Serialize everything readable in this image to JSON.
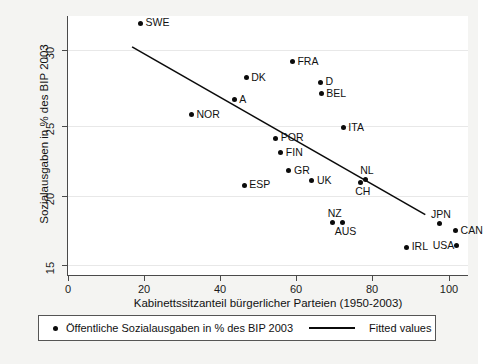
{
  "chart_data": {
    "type": "scatter",
    "title": "",
    "xlabel": "Kabinettssitzanteil bürgerlicher Parteien (1950-2003)",
    "ylabel": "Sozialausgaben in % des BIP 2003",
    "xlim": [
      0,
      103
    ],
    "ylim": [
      14.2,
      31.8
    ],
    "xticks": [
      0,
      20,
      40,
      60,
      80,
      100
    ],
    "yticks": [
      15,
      20,
      25,
      30
    ],
    "grid": true,
    "grid_axis": "y",
    "legend_position": "below-axes",
    "legend": [
      {
        "marker": "dot",
        "label": "Öffentliche Sozialausgaben in % des BIP  2003"
      },
      {
        "marker": "line",
        "label": "Fitted values"
      }
    ],
    "points": [
      {
        "label": "SWE",
        "x": 18.7,
        "y": 31.3,
        "label_pos": "right"
      },
      {
        "label": "DK",
        "x": 45.9,
        "y": 27.6,
        "label_pos": "right"
      },
      {
        "label": "FRA",
        "x": 57.8,
        "y": 28.7,
        "label_pos": "right"
      },
      {
        "label": "D",
        "x": 65.0,
        "y": 27.3,
        "label_pos": "right"
      },
      {
        "label": "BEL",
        "x": 65.2,
        "y": 26.5,
        "label_pos": "right"
      },
      {
        "label": "A",
        "x": 42.8,
        "y": 26.1,
        "label_pos": "right"
      },
      {
        "label": "NOR",
        "x": 31.8,
        "y": 25.1,
        "label_pos": "right"
      },
      {
        "label": "ITA",
        "x": 70.9,
        "y": 24.2,
        "label_pos": "right"
      },
      {
        "label": "POR",
        "x": 53.5,
        "y": 23.5,
        "label_pos": "right"
      },
      {
        "label": "FIN",
        "x": 54.8,
        "y": 22.5,
        "label_pos": "right"
      },
      {
        "label": "GR",
        "x": 56.9,
        "y": 21.3,
        "label_pos": "right"
      },
      {
        "label": "UK",
        "x": 62.8,
        "y": 20.6,
        "label_pos": "right"
      },
      {
        "label": "ESP",
        "x": 45.4,
        "y": 20.3,
        "label_pos": "right"
      },
      {
        "label": "NL",
        "x": 76.6,
        "y": 20.7,
        "label_pos": "above"
      },
      {
        "label": "CH",
        "x": 75.3,
        "y": 20.5,
        "label_pos": "below"
      },
      {
        "label": "NZ",
        "x": 68.2,
        "y": 17.8,
        "label_pos": "above"
      },
      {
        "label": "AUS",
        "x": 70.8,
        "y": 17.8,
        "label_pos": "below"
      },
      {
        "label": "JPN",
        "x": 95.6,
        "y": 17.7,
        "label_pos": "above"
      },
      {
        "label": "CAN",
        "x": 99.8,
        "y": 17.2,
        "label_pos": "right"
      },
      {
        "label": "USA",
        "x": 100.0,
        "y": 16.2,
        "label_pos": "left"
      },
      {
        "label": "IRL",
        "x": 87.2,
        "y": 16.1,
        "label_pos": "right"
      }
    ],
    "fit_line": {
      "label": "Fitted values",
      "x_start": 16.5,
      "y_start": 29.7,
      "x_end": 92.0,
      "y_end": 18.3
    }
  }
}
